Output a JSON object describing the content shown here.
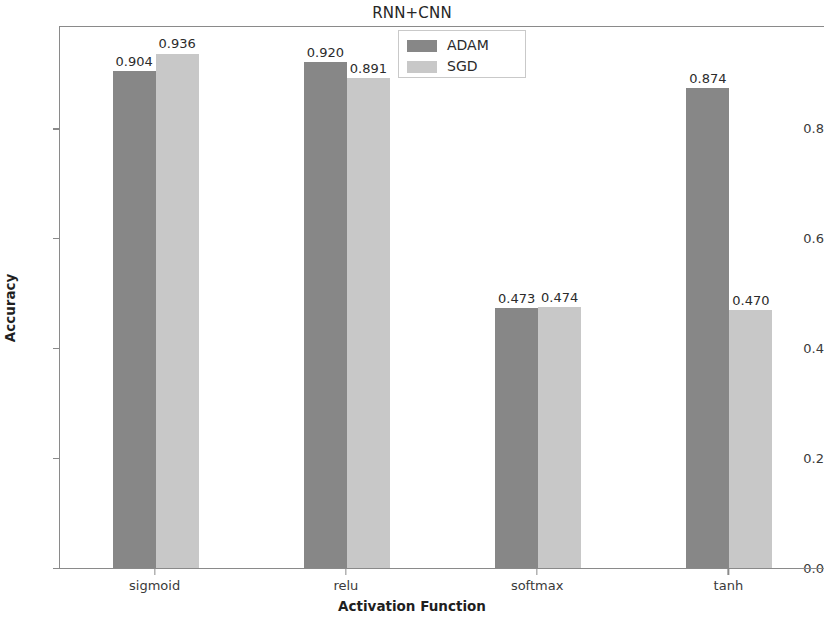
{
  "chart_data": {
    "type": "bar",
    "title": "RNN+CNN",
    "xlabel": "Activation Function",
    "ylabel": "Accuracy",
    "categories": [
      "sigmoid",
      "relu",
      "softmax",
      "tanh"
    ],
    "series": [
      {
        "name": "ADAM",
        "color": "#878787",
        "values": [
          0.904,
          0.92,
          0.473,
          0.874
        ]
      },
      {
        "name": "SGD",
        "color": "#c8c8c8",
        "values": [
          0.936,
          0.891,
          0.474,
          0.47
        ]
      }
    ],
    "value_labels": [
      [
        "0.904",
        "0.920",
        "0.473",
        "0.874"
      ],
      [
        "0.936",
        "0.891",
        "0.474",
        "0.470"
      ]
    ],
    "yticks": [
      0.0,
      0.2,
      0.4,
      0.6,
      0.8
    ],
    "ytick_labels": [
      "0.0",
      "0.2",
      "0.4",
      "0.6",
      "0.8"
    ],
    "ylim": [
      0.0,
      0.986
    ],
    "grid": false,
    "legend_position": "upper center"
  },
  "legend": {
    "entries": [
      {
        "label": "ADAM"
      },
      {
        "label": "SGD"
      }
    ]
  }
}
